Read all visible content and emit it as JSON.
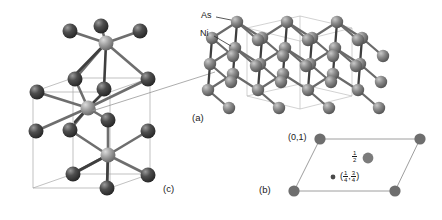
{
  "figure": {
    "background": "#ffffff"
  },
  "colors": {
    "as_atom": "#7d7d7d",
    "ni_atom": "#8c8c8c",
    "dark_atom": "#3c3c3c",
    "bond_dark": "#4a4a4a",
    "bond_light": "#9a9a9a",
    "cell_edge": "#9e9e9e",
    "text": "#1a1a1a"
  },
  "panels": {
    "a": {
      "label": "(a)",
      "atom_labels": [
        {
          "name": "As",
          "text": "As"
        },
        {
          "name": "Ni",
          "text": "Ni"
        }
      ]
    },
    "c": {
      "label": "(c)"
    },
    "b": {
      "label": "(b)",
      "corner_label": "(0,1)",
      "mid_label_num": "1",
      "mid_label_den": "2",
      "inner_label_open": "(",
      "inner_label_close": ")",
      "inner_label_comma": ",",
      "inner_frac1_num": "1",
      "inner_frac1_den": "4",
      "inner_frac2_num": "3",
      "inner_frac2_den": "4"
    }
  }
}
